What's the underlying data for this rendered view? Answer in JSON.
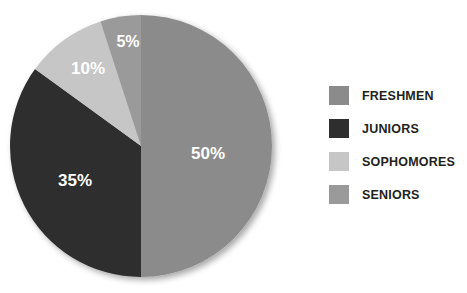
{
  "chart_data": {
    "type": "pie",
    "title": "",
    "categories": [
      "FRESHMEN",
      "JUNIORS",
      "SOPHOMORES",
      "SENIORS"
    ],
    "values": [
      50,
      35,
      10,
      5
    ],
    "value_labels": [
      "50%",
      "35%",
      "10%",
      "5%"
    ],
    "unit": "percent",
    "total": 100,
    "legend_position": "right",
    "grid": false,
    "start_angle_deg": 0,
    "direction": "clockwise-from-top-for-first-slice",
    "slices": [
      {
        "label": "FRESHMEN",
        "value": 50,
        "display": "50%",
        "color": "#8b8b8b",
        "start_deg": 0,
        "end_deg": 180,
        "label_x": 208,
        "label_y": 155
      },
      {
        "label": "JUNIORS",
        "value": 35,
        "display": "35%",
        "color": "#2e2e2e",
        "start_deg": 180,
        "end_deg": 306,
        "label_x": 75,
        "label_y": 182
      },
      {
        "label": "SOPHOMORES",
        "value": 10,
        "display": "10%",
        "color": "#c6c6c6",
        "start_deg": 306,
        "end_deg": 342,
        "label_x": 88,
        "label_y": 70
      },
      {
        "label": "SENIORS",
        "value": 5,
        "display": "5%",
        "color": "#9a9a9a",
        "start_deg": 342,
        "end_deg": 360,
        "label_x": 128,
        "label_y": 43
      }
    ],
    "geometry": {
      "center_x": 141,
      "center_y": 146,
      "radius": 131
    }
  },
  "legend": {
    "items": [
      {
        "label": "FRESHMEN",
        "color": "#8b8b8b"
      },
      {
        "label": "JUNIORS",
        "color": "#2e2e2e"
      },
      {
        "label": "SOPHOMORES",
        "color": "#c6c6c6"
      },
      {
        "label": "SENIORS",
        "color": "#9a9a9a"
      }
    ]
  },
  "colors": {
    "background": "#ffffff",
    "label_text": "#ffffff",
    "legend_text": "#231f20"
  }
}
